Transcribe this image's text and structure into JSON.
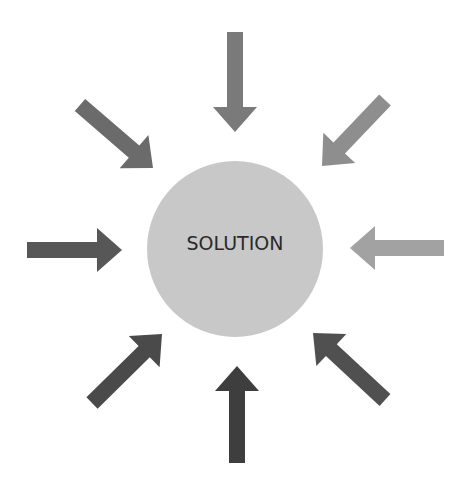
{
  "diagram": {
    "center_label": "SOLUTION",
    "circle": {
      "cx": 235,
      "cy": 249,
      "r": 88,
      "color": "#c8c8c8"
    },
    "arrows": [
      {
        "direction": "top",
        "from": [
          235,
          32
        ],
        "to": [
          235,
          132
        ],
        "color": "#7a7a7a"
      },
      {
        "direction": "top-right",
        "from": [
          385,
          100
        ],
        "to": [
          322,
          166
        ],
        "color": "#8e8e8e"
      },
      {
        "direction": "right",
        "from": [
          444,
          248
        ],
        "to": [
          350,
          248
        ],
        "color": "#a2a2a2"
      },
      {
        "direction": "bottom-right",
        "from": [
          385,
          400
        ],
        "to": [
          313,
          333
        ],
        "color": "#505050"
      },
      {
        "direction": "bottom",
        "from": [
          237,
          463
        ],
        "to": [
          237,
          366
        ],
        "color": "#3e3e3e"
      },
      {
        "direction": "bottom-left",
        "from": [
          92,
          403
        ],
        "to": [
          162,
          334
        ],
        "color": "#4a4a4a"
      },
      {
        "direction": "left",
        "from": [
          27,
          250
        ],
        "to": [
          122,
          250
        ],
        "color": "#575757"
      },
      {
        "direction": "top-left",
        "from": [
          80,
          105
        ],
        "to": [
          153,
          168
        ],
        "color": "#6b6b6b"
      }
    ]
  }
}
